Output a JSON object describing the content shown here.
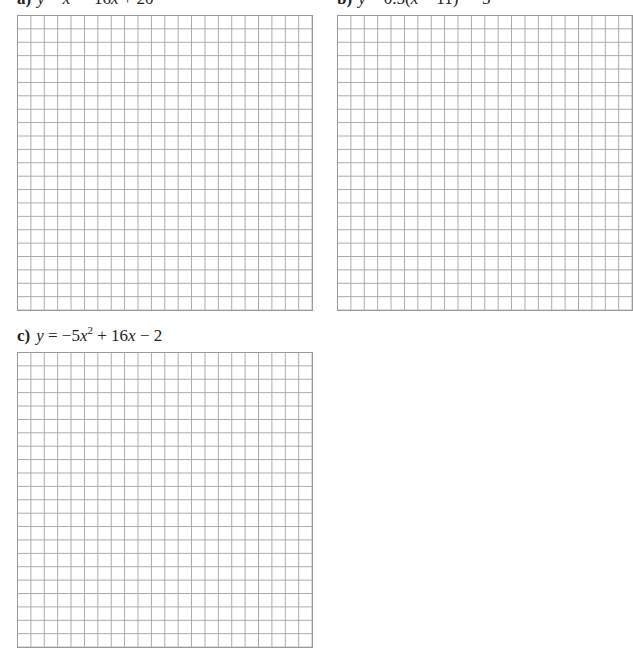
{
  "problems": [
    {
      "id": "a",
      "label": "a)",
      "equation_parts": {
        "y": "y",
        "eq": " = ",
        "x1": "x",
        "sup": "2",
        "rest1": " − 16",
        "x2": "x",
        "rest2": " + 20"
      },
      "grid": {
        "columns": 22,
        "rows": 22
      }
    },
    {
      "id": "b",
      "label": "b)",
      "equation_parts": {
        "y": "y",
        "eq": " = 0.5(",
        "x1": "x",
        "rest1": " − 11)",
        "sup": "2",
        "rest2": " − 5"
      },
      "grid": {
        "columns": 21,
        "rows": 22
      }
    },
    {
      "id": "c",
      "label": "c)",
      "equation_parts": {
        "y": "y",
        "eq": " = −5",
        "x1": "x",
        "sup": "2",
        "rest1": " + 16",
        "x2": "x",
        "rest2": " − 2"
      },
      "grid": {
        "columns": 22,
        "rows": 22
      }
    }
  ],
  "colors": {
    "grid_line": "#a8a8a8",
    "grid_border": "#9a9a9a",
    "text": "#222222"
  }
}
